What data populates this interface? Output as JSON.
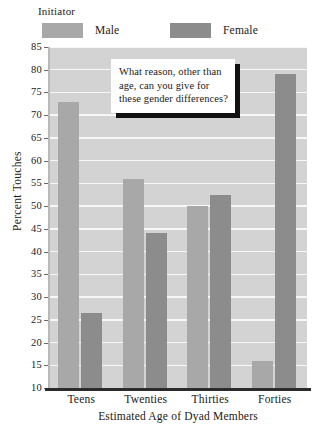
{
  "legend": {
    "title": "Initiator",
    "entries": [
      {
        "label": "Male",
        "color": "#a8a8a8"
      },
      {
        "label": "Female",
        "color": "#8c8c8c"
      }
    ]
  },
  "callout": {
    "lines": [
      "What reason, other than",
      "age, can you give for",
      "these gender differences?"
    ]
  },
  "axes": {
    "ylabel": "Percent Touches",
    "xlabel": "Estimated Age of Dyad Members",
    "yticks": [
      "85",
      "80",
      "75",
      "70",
      "65",
      "60",
      "55",
      "50",
      "45",
      "40",
      "35",
      "30",
      "25",
      "20",
      "15",
      "10"
    ]
  },
  "chart_data": {
    "type": "bar",
    "title": "",
    "xlabel": "Estimated Age of Dyad Members",
    "ylabel": "Percent Touches",
    "categories": [
      "Teens",
      "Twenties",
      "Thirties",
      "Forties"
    ],
    "series": [
      {
        "name": "Male",
        "color": "#a8a8a8",
        "values": [
          73,
          56,
          50,
          16
        ]
      },
      {
        "name": "Female",
        "color": "#8c8c8c",
        "values": [
          26.5,
          44,
          52.5,
          79
        ]
      }
    ],
    "ylim": [
      10,
      85
    ],
    "ytick_step": 5,
    "yticks": [
      10,
      15,
      20,
      25,
      30,
      35,
      40,
      45,
      50,
      55,
      60,
      65,
      70,
      75,
      80,
      85
    ],
    "grid": "horizontal-white-on-gray",
    "legend_position": "above-plot-left",
    "legend_title": "Initiator",
    "plot_background": "#d3d3d3",
    "annotation": "What reason, other than age, can you give for these gender differences?"
  }
}
